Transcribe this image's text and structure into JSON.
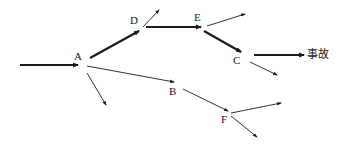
{
  "diagram": {
    "type": "event-tree",
    "nodes": [
      {
        "id": "A",
        "label": "A",
        "x": 74,
        "y": 51
      },
      {
        "id": "D",
        "label": "D",
        "x": 130,
        "y": 15
      },
      {
        "id": "E",
        "label": "E",
        "x": 194,
        "y": 12
      },
      {
        "id": "C",
        "label": "C",
        "x": 233,
        "y": 55
      },
      {
        "id": "B",
        "label": "B",
        "x": 169,
        "y": 86
      },
      {
        "id": "F",
        "label": "F",
        "x": 221,
        "y": 114
      }
    ],
    "outcome": {
      "label": "事故",
      "x": 307,
      "y": 49
    },
    "edges": [
      {
        "from": "input",
        "to": "A",
        "x1": 20,
        "y1": 65,
        "x2": 78,
        "y2": 65,
        "weight": "thick"
      },
      {
        "from": "A",
        "to": "D",
        "x1": 90,
        "y1": 58,
        "x2": 139,
        "y2": 31,
        "weight": "thick"
      },
      {
        "from": "D",
        "to": "E",
        "x1": 146,
        "y1": 27,
        "x2": 201,
        "y2": 27,
        "weight": "thick"
      },
      {
        "from": "E",
        "to": "C",
        "x1": 204,
        "y1": 31,
        "x2": 241,
        "y2": 52,
        "weight": "thick"
      },
      {
        "from": "C",
        "to": "事故",
        "x1": 254,
        "y1": 55,
        "x2": 304,
        "y2": 55,
        "weight": "thick"
      },
      {
        "from": "D",
        "to": "branch",
        "x1": 143,
        "y1": 27,
        "x2": 159,
        "y2": 10,
        "weight": "thin"
      },
      {
        "from": "E",
        "to": "branch",
        "x1": 207,
        "y1": 26,
        "x2": 245,
        "y2": 14,
        "weight": "thin"
      },
      {
        "from": "C",
        "to": "branch",
        "x1": 250,
        "y1": 62,
        "x2": 277,
        "y2": 75,
        "weight": "thin"
      },
      {
        "from": "A",
        "to": "B",
        "x1": 87,
        "y1": 66,
        "x2": 174,
        "y2": 82,
        "weight": "thin"
      },
      {
        "from": "A",
        "to": "branch",
        "x1": 87,
        "y1": 73,
        "x2": 106,
        "y2": 105,
        "weight": "thin"
      },
      {
        "from": "B",
        "to": "F",
        "x1": 183,
        "y1": 89,
        "x2": 228,
        "y2": 111,
        "weight": "thin"
      },
      {
        "from": "F",
        "to": "branch",
        "x1": 231,
        "y1": 113,
        "x2": 281,
        "y2": 103,
        "weight": "thin"
      },
      {
        "from": "F",
        "to": "branch",
        "x1": 231,
        "y1": 116,
        "x2": 257,
        "y2": 137,
        "weight": "thin"
      }
    ],
    "colors": {
      "line": "#1a1a1a",
      "background": "#ffffff"
    }
  }
}
